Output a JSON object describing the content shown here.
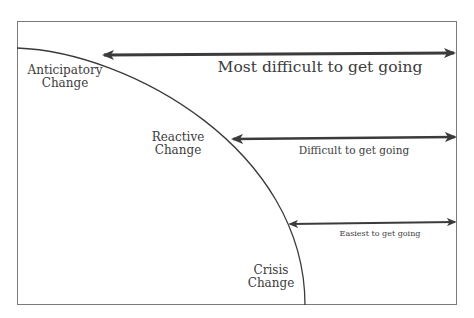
{
  "diagram": {
    "type": "change-difficulty-curve",
    "colors": {
      "frame": "#7a7a7a",
      "curve": "#3a3a3a",
      "arrow": "#3b3b3b",
      "text": "#3c3c3c"
    },
    "stages": [
      {
        "label_line1": "Anticipatory",
        "label_line2": "Change"
      },
      {
        "label_line1": "Reactive",
        "label_line2": "Change"
      },
      {
        "label_line1": "Crisis",
        "label_line2": "Change"
      }
    ],
    "arrows": [
      {
        "label": "Most difficult to get going"
      },
      {
        "label": "Difficult to get going"
      },
      {
        "label": "Easiest to get going"
      }
    ]
  }
}
